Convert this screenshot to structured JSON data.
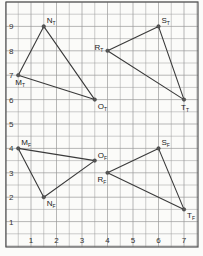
{
  "diagram": {
    "type": "coordinate-grid",
    "x_axis": {
      "ticks": [
        "1",
        "2",
        "3",
        "4",
        "5",
        "6",
        "7"
      ],
      "range": [
        0,
        7.5
      ]
    },
    "y_axis": {
      "ticks": [
        "1",
        "2",
        "3",
        "4",
        "5",
        "6",
        "7",
        "8",
        "9"
      ],
      "range": [
        0,
        10
      ]
    },
    "colors": {
      "grid": "#9a9a9a",
      "frame": "#555555",
      "line": "#3a3a3a",
      "point": "#555555",
      "background": "#fbfbf9"
    },
    "triangles": [
      {
        "name": "triangle-MNO-T",
        "points": [
          {
            "label": "M",
            "sub": "T",
            "x": 0.5,
            "y": 7,
            "label_pos": "below"
          },
          {
            "label": "N",
            "sub": "T",
            "x": 1.5,
            "y": 9,
            "label_pos": "above-right"
          },
          {
            "label": "O",
            "sub": "T",
            "x": 3.5,
            "y": 6,
            "label_pos": "below-right"
          }
        ]
      },
      {
        "name": "triangle-RST-T",
        "points": [
          {
            "label": "R",
            "sub": "T",
            "x": 4,
            "y": 8,
            "label_pos": "left"
          },
          {
            "label": "S",
            "sub": "T",
            "x": 6,
            "y": 9,
            "label_pos": "above-right"
          },
          {
            "label": "T",
            "sub": "T",
            "x": 7,
            "y": 6,
            "label_pos": "below"
          }
        ]
      },
      {
        "name": "triangle-MNO-F",
        "points": [
          {
            "label": "M",
            "sub": "F",
            "x": 0.5,
            "y": 4,
            "label_pos": "above-right"
          },
          {
            "label": "N",
            "sub": "F",
            "x": 1.5,
            "y": 2,
            "label_pos": "below-right"
          },
          {
            "label": "O",
            "sub": "F",
            "x": 3.5,
            "y": 3.5,
            "label_pos": "above-right"
          }
        ]
      },
      {
        "name": "triangle-RST-F",
        "points": [
          {
            "label": "R",
            "sub": "F",
            "x": 4,
            "y": 3,
            "label_pos": "below-left"
          },
          {
            "label": "S",
            "sub": "F",
            "x": 6,
            "y": 4,
            "label_pos": "above-right"
          },
          {
            "label": "T",
            "sub": "F",
            "x": 7,
            "y": 1.5,
            "label_pos": "below-right"
          }
        ]
      }
    ]
  }
}
